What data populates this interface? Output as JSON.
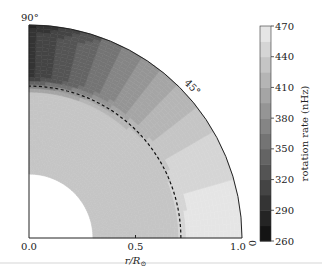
{
  "chart_data": {
    "type": "heatmap",
    "projection": "polar-quarter",
    "title": "",
    "xlabel": "r/R⊙",
    "x_ticks": [
      "0.0",
      "0.5",
      "1.0"
    ],
    "angle_labels": [
      "90°",
      "45°",
      "0"
    ],
    "radial_range": [
      0.0,
      1.0
    ],
    "inner_boundary_r": 0.3,
    "tachocline_r": 0.713,
    "colorbar": {
      "label": "rotation rate (nHz)",
      "range": [
        260,
        470
      ],
      "ticks": [
        "470",
        "440",
        "410",
        "380",
        "350",
        "320",
        "290",
        "260"
      ],
      "colormap": "gray"
    },
    "rotation_profile": {
      "description": "Solar internal rotation: fast equator, slow poles, uniform radiative core",
      "core_rate_nHz": 432,
      "surface_rate_by_latitude_nHz": [
        {
          "latitude_deg": 0,
          "rate": 462
        },
        {
          "latitude_deg": 15,
          "rate": 455
        },
        {
          "latitude_deg": 30,
          "rate": 440
        },
        {
          "latitude_deg": 45,
          "rate": 410
        },
        {
          "latitude_deg": 60,
          "rate": 375
        },
        {
          "latitude_deg": 75,
          "rate": 335
        },
        {
          "latitude_deg": 90,
          "rate": 300
        }
      ]
    }
  }
}
